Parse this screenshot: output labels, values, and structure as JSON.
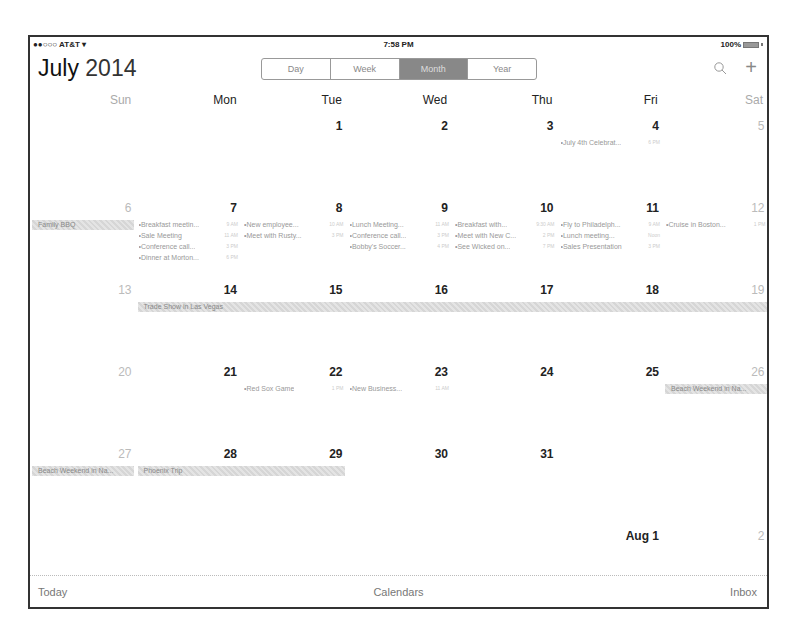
{
  "status_bar": {
    "carrier": "●●○○○ AT&T",
    "wifi_icon": "▾",
    "time": "7:58 PM",
    "battery": "100%"
  },
  "header": {
    "month": "July",
    "year": "2014",
    "view_tabs": [
      {
        "label": "Day",
        "active": false
      },
      {
        "label": "Week",
        "active": false
      },
      {
        "label": "Month",
        "active": true
      },
      {
        "label": "Year",
        "active": false
      }
    ],
    "add_label": "+"
  },
  "weekdays": [
    "Sun",
    "Mon",
    "Tue",
    "Wed",
    "Thu",
    "Fri",
    "Sat"
  ],
  "weeks": [
    {
      "days": [
        "",
        "",
        "1",
        "2",
        "3",
        "4",
        "5"
      ],
      "events": {
        "5": [
          {
            "name": "July 4th Celebrat...",
            "time": "6 PM"
          }
        ]
      },
      "allday": []
    },
    {
      "days": [
        "6",
        "7",
        "8",
        "9",
        "10",
        "11",
        "12"
      ],
      "events": {
        "1": [
          {
            "name": "Breakfast meetin...",
            "time": "9 AM"
          },
          {
            "name": "Sale Meeting",
            "time": "11 AM"
          },
          {
            "name": "Conference call...",
            "time": "3 PM"
          },
          {
            "name": "Dinner at Morton...",
            "time": "6 PM"
          }
        ],
        "2": [
          {
            "name": "New employee...",
            "time": "10 AM"
          },
          {
            "name": "Meet with Rusty...",
            "time": "3 PM"
          }
        ],
        "3": [
          {
            "name": "Lunch Meeting...",
            "time": "11 AM"
          },
          {
            "name": "Conference call...",
            "time": "3 PM"
          },
          {
            "name": "Bobby's Soccer...",
            "time": "4 PM"
          }
        ],
        "4": [
          {
            "name": "Breakfast with...",
            "time": "9:30 AM"
          },
          {
            "name": "Meet with New C...",
            "time": "2 PM"
          },
          {
            "name": "See Wicked on...",
            "time": "7 PM"
          }
        ],
        "5": [
          {
            "name": "Fly to Philadelph...",
            "time": "9 AM"
          },
          {
            "name": "Lunch meeting...",
            "time": "Noon"
          },
          {
            "name": "Sales Presentation",
            "time": "3 PM"
          }
        ],
        "6": [
          {
            "name": "Cruise in Boston...",
            "time": "1 PM"
          }
        ]
      },
      "allday": [
        {
          "label": "Family BBQ",
          "start": 0,
          "span": 1
        }
      ]
    },
    {
      "days": [
        "13",
        "14",
        "15",
        "16",
        "17",
        "18",
        "19"
      ],
      "events": {},
      "allday": [
        {
          "label": "Trade Show in Las Vegas",
          "start": 1,
          "span": 6
        }
      ]
    },
    {
      "days": [
        "20",
        "21",
        "22",
        "23",
        "24",
        "25",
        "26"
      ],
      "events": {
        "2": [
          {
            "name": "Red Sox Game",
            "time": "1 PM"
          }
        ],
        "3": [
          {
            "name": "New Business...",
            "time": "11 AM"
          }
        ]
      },
      "allday": [
        {
          "label": "Beach Weekend in Na...",
          "start": 6,
          "span": 1
        }
      ]
    },
    {
      "days": [
        "27",
        "28",
        "29",
        "30",
        "31",
        "",
        ""
      ],
      "events": {},
      "allday": [
        {
          "label": "Beach Weekend in Na...",
          "start": 0,
          "span": 1
        },
        {
          "label": "Phoenix Trip",
          "start": 1,
          "span": 2
        }
      ]
    }
  ],
  "next_month": {
    "fri_label": "Aug 1",
    "sat_label": "2"
  },
  "toolbar": {
    "today": "Today",
    "calendars": "Calendars",
    "inbox": "Inbox"
  }
}
